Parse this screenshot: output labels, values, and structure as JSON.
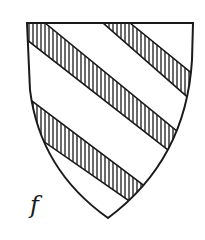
{
  "figure": {
    "label": "f",
    "colors": {
      "outline": "#1a1a1a",
      "field": "#ffffff",
      "hatch": "#1a1a1a"
    }
  }
}
